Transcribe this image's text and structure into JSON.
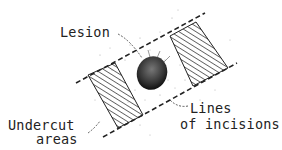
{
  "figure": {
    "type": "surgical-diagram",
    "labels": {
      "lesion": "Lesion",
      "lines_line1": "Lines",
      "lines_line2": "of incisions",
      "undercut_line1": "Undercut",
      "undercut_line2": "areas"
    },
    "colors": {
      "ink": "#222222",
      "stipple": "#9a9a9a",
      "background": "#ffffff"
    }
  }
}
